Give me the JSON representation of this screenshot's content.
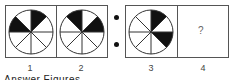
{
  "figures": [
    {
      "label": "1",
      "shaded_segments": [
        0,
        6
      ],
      "box": {
        "x": 5,
        "y": 5,
        "w": 51,
        "h": 53
      }
    },
    {
      "label": "2",
      "shaded_segments": [
        1,
        7
      ],
      "box": {
        "x": 56,
        "y": 5,
        "w": 51,
        "h": 53
      }
    },
    {
      "label": "3",
      "shaded_segments": [
        0,
        2
      ],
      "box": {
        "x": 125,
        "y": 5,
        "w": 52,
        "h": 53
      }
    },
    {
      "label": "4",
      "content": "?",
      "box": {
        "x": 177,
        "y": 5,
        "w": 52,
        "h": 53
      }
    }
  ],
  "separator": {
    "symbol": "dots",
    "count": 2
  },
  "caption": "Answer Figures",
  "colors": {
    "shade": "#111111",
    "stroke": "#333333",
    "border": "#555555"
  }
}
